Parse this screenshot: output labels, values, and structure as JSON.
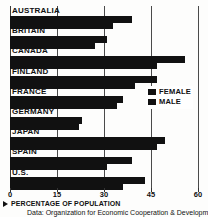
{
  "chart_data": {
    "type": "bar",
    "orientation": "horizontal",
    "title": "",
    "xlabel": "PERCENTAGE OF POPULATION",
    "ylabel": "",
    "xlim": [
      0,
      60
    ],
    "xticks": [
      0,
      15,
      30,
      45,
      60
    ],
    "xtick_labels": [
      "0",
      "15",
      "30",
      "45",
      "60"
    ],
    "grid": true,
    "grid_axis": "x",
    "legend_position": "right-middle",
    "categories": [
      "AUSTRALIA",
      "BRITAIN",
      "CANADA",
      "FINLAND",
      "FRANCE",
      "GERMANY",
      "JAPAN",
      "SPAIN",
      "U.S."
    ],
    "series": [
      {
        "name": "FEMALE",
        "color": "#111111",
        "values": [
          39,
          31,
          56,
          47,
          36,
          23,
          49.5,
          39,
          43
        ]
      },
      {
        "name": "MALE",
        "color": "#111111",
        "values": [
          33,
          27,
          47,
          40,
          34,
          22,
          47,
          31,
          36
        ]
      }
    ],
    "source_note": "Data: Organization for Economic Cooperation & Development"
  },
  "legend": {
    "items": [
      {
        "label": "FEMALE"
      },
      {
        "label": "MALE"
      }
    ]
  },
  "footer": {
    "axis_caption": "PERCENTAGE OF POPULATION",
    "source": "Data: Organization for Economic Cooperation & Development"
  }
}
